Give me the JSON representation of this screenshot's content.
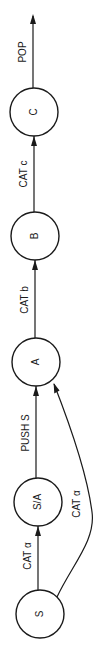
{
  "diagram": {
    "type": "state-transition",
    "orientation": "rotated-90-ccw",
    "nodes": [
      {
        "id": "S",
        "label": "S"
      },
      {
        "id": "SA",
        "label": "S/A"
      },
      {
        "id": "A",
        "label": "A"
      },
      {
        "id": "B",
        "label": "B"
      },
      {
        "id": "C",
        "label": "C"
      }
    ],
    "edges": [
      {
        "from": "S",
        "to": "SA",
        "label": "CAT α"
      },
      {
        "from": "SA",
        "to": "A",
        "label": "PUSH S"
      },
      {
        "from": "S",
        "to": "A",
        "label": "CAT α"
      },
      {
        "from": "A",
        "to": "B",
        "label": "CAT b"
      },
      {
        "from": "B",
        "to": "C",
        "label": "CAT c"
      },
      {
        "from": "C",
        "to": "exit",
        "label": "POP"
      }
    ]
  }
}
